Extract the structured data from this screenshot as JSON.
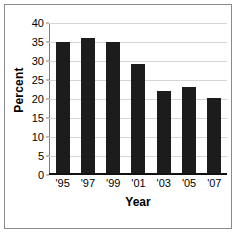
{
  "chart_data": {
    "type": "bar",
    "title": "",
    "xlabel": "Year",
    "ylabel": "Percent",
    "categories": [
      "'95",
      "'97",
      "'99",
      "'01",
      "'03",
      "'05",
      "'07"
    ],
    "values": [
      35,
      36,
      35,
      29,
      22,
      23,
      20
    ],
    "ylim": [
      0,
      40
    ],
    "ytick_labels": [
      "40",
      "35",
      "30",
      "25",
      "20",
      "15",
      "10",
      "5",
      "0"
    ],
    "ytick_values": [
      40,
      35,
      30,
      25,
      20,
      15,
      10,
      5,
      0
    ],
    "grid": true,
    "legend": "none",
    "bar_color": "#1c1c1c",
    "gridline_color": "#d5d5d5",
    "axis_color": "#111111",
    "frame_color": "#8a8a8a",
    "background": "#ffffff"
  }
}
